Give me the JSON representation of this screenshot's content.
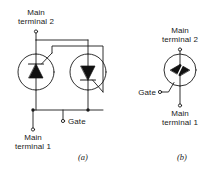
{
  "figure": {
    "title_caption_a": "(a)",
    "title_caption_b": "(b)",
    "stroke_color": "#1a1a1a",
    "fill_color": "#111111",
    "background": "#ffffff"
  },
  "diagram_a": {
    "name": "inverse-parallel-scr-pair",
    "labels": {
      "main_terminal_2": "Main\nterminal 2",
      "main_terminal_1": "Main\nterminal 1",
      "gate": "Gate"
    },
    "devices": [
      {
        "name": "scr-left",
        "symbol": "thyristor",
        "arrow_direction": "up"
      },
      {
        "name": "scr-right",
        "symbol": "thyristor",
        "arrow_direction": "down"
      }
    ],
    "terminals": [
      {
        "name": "main-terminal-2",
        "kind": "node-dot"
      },
      {
        "name": "main-terminal-1",
        "kind": "node-dot"
      },
      {
        "name": "gate",
        "kind": "node-dot"
      }
    ]
  },
  "diagram_b": {
    "name": "triac-symbol",
    "labels": {
      "main_terminal_2": "Main\nterminal 2",
      "main_terminal_1": "Main\nterminal 1",
      "gate": "Gate"
    },
    "devices": [
      {
        "name": "triac",
        "symbol": "triac",
        "arrow_direction": "bidirectional"
      }
    ],
    "terminals": [
      {
        "name": "main-terminal-2",
        "kind": "node-dot"
      },
      {
        "name": "main-terminal-1",
        "kind": "node-dot"
      },
      {
        "name": "gate",
        "kind": "node-dot"
      }
    ]
  }
}
